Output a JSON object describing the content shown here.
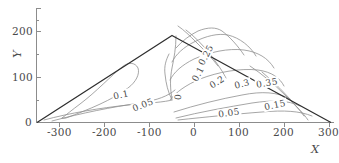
{
  "figure": {
    "type": "contour",
    "line_color": "#8a8a8a",
    "boundary_color": "#2e2e2e",
    "axis_color": "#8c8c8c",
    "text_color": "#4a4a4a",
    "background": "#ffffff"
  },
  "axes": {
    "x": {
      "name": "X",
      "ticks": [
        -300,
        -200,
        -100,
        0,
        100,
        200,
        300
      ],
      "tick_labels": [
        "-300",
        "-200",
        "-100",
        "0",
        "100",
        "200",
        "300"
      ],
      "range": [
        -360,
        380
      ]
    },
    "y": {
      "name": "Y",
      "ticks": [
        0,
        100,
        200
      ],
      "tick_labels": [
        "0",
        "100",
        "200"
      ],
      "range": [
        0,
        255
      ]
    }
  },
  "chart_data": {
    "type": "contour",
    "title": "",
    "xlabel": "X",
    "ylabel": "Y",
    "xlim": [
      -360,
      380
    ],
    "ylim": [
      0,
      255
    ],
    "grid": false,
    "legend": "none",
    "domain_shape": "triangle",
    "domain_vertices": [
      [
        -340,
        0
      ],
      [
        10,
        225
      ],
      [
        355,
        0
      ]
    ],
    "levels": [
      0,
      0.05,
      0.1,
      0.15,
      0.2,
      0.25,
      0.3,
      0.35
    ],
    "labeled_contours": [
      {
        "level": "0.1",
        "x": -150,
        "y": 62,
        "rot": -12
      },
      {
        "level": "0.05",
        "x": -95,
        "y": 40,
        "rot": -22
      },
      {
        "level": "0",
        "x": -8,
        "y": 56,
        "rot": -85
      },
      {
        "level": "0.1",
        "x": 42,
        "y": 108,
        "rot": -62
      },
      {
        "level": "0.25",
        "x": 62,
        "y": 150,
        "rot": -62
      },
      {
        "level": "0.2",
        "x": 88,
        "y": 90,
        "rot": -32
      },
      {
        "level": "0.3",
        "x": 150,
        "y": 86,
        "rot": -14
      },
      {
        "level": "0.35",
        "x": 213,
        "y": 88,
        "rot": -10
      },
      {
        "level": "0.15",
        "x": 232,
        "y": 40,
        "rot": -12
      },
      {
        "level": "0.05",
        "x": 120,
        "y": 22,
        "rot": -8
      }
    ]
  }
}
